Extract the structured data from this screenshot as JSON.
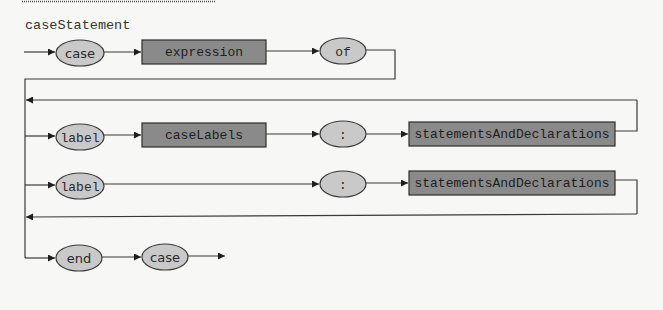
{
  "diagram": {
    "title": "caseStatement",
    "colors": {
      "background": "#f7f7f5",
      "terminal_fill": "#c9c9c9",
      "nonterminal_fill": "#8a8a8a",
      "line": "#3a3a3a"
    },
    "rows": [
      {
        "id": "header",
        "elements": [
          {
            "kind": "terminal",
            "text": "case"
          },
          {
            "kind": "nonterminal",
            "text": "expression"
          },
          {
            "kind": "terminal",
            "text": "of"
          }
        ]
      },
      {
        "id": "labeled-branch",
        "elements": [
          {
            "kind": "terminal",
            "text": "label"
          },
          {
            "kind": "nonterminal",
            "text": "caseLabels"
          },
          {
            "kind": "terminal",
            "text": ":"
          },
          {
            "kind": "nonterminal",
            "text": "statementsAndDeclarations"
          }
        ]
      },
      {
        "id": "default-branch",
        "elements": [
          {
            "kind": "terminal",
            "text": "label"
          },
          {
            "kind": "terminal",
            "text": ":"
          },
          {
            "kind": "nonterminal",
            "text": "statementsAndDeclarations"
          }
        ]
      },
      {
        "id": "footer",
        "elements": [
          {
            "kind": "terminal",
            "text": "end"
          },
          {
            "kind": "terminal",
            "text": "case"
          }
        ]
      }
    ]
  }
}
